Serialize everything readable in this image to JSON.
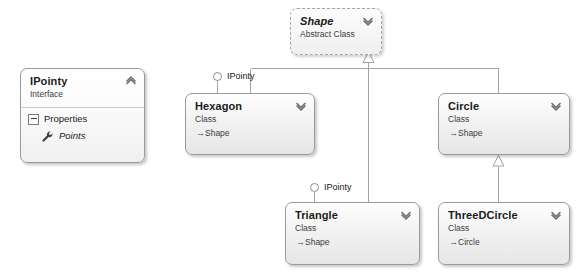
{
  "diagram": {
    "background": "#ffffff",
    "line_color": "#a0a0a0",
    "node_border": "#9a9a9a"
  },
  "nodes": {
    "shape": {
      "name": "Shape",
      "stereotype": "Abstract Class",
      "toggle": "chevron-down",
      "style": "abstract"
    },
    "ipointy": {
      "name": "IPointy",
      "stereotype": "Interface",
      "toggle": "chevron-up",
      "style": "interface",
      "compartment": {
        "label": "Properties",
        "expander": "collapse-box",
        "members": [
          {
            "name": "Points",
            "icon": "wrench-icon"
          }
        ]
      }
    },
    "hexagon": {
      "name": "Hexagon",
      "stereotype": "Class",
      "base": "Shape",
      "base_arrow": "→",
      "toggle": "chevron-down"
    },
    "circle": {
      "name": "Circle",
      "stereotype": "Class",
      "base": "Shape",
      "base_arrow": "→",
      "toggle": "chevron-down"
    },
    "triangle": {
      "name": "Triangle",
      "stereotype": "Class",
      "base": "Shape",
      "base_arrow": "→",
      "toggle": "chevron-down"
    },
    "threedcircle": {
      "name": "ThreeDCircle",
      "stereotype": "Class",
      "base": "Circle",
      "base_arrow": "→",
      "toggle": "chevron-down"
    }
  },
  "lollipops": [
    {
      "id": "hexagon-ipointy",
      "label": "IPointy",
      "attached_to": "Hexagon"
    },
    {
      "id": "triangle-ipointy",
      "label": "IPointy",
      "attached_to": "Triangle"
    }
  ],
  "relationships": [
    {
      "type": "inheritance",
      "from": "Hexagon",
      "to": "Shape"
    },
    {
      "type": "inheritance",
      "from": "Circle",
      "to": "Shape"
    },
    {
      "type": "inheritance",
      "from": "Triangle",
      "to": "Shape"
    },
    {
      "type": "inheritance",
      "from": "ThreeDCircle",
      "to": "Circle"
    },
    {
      "type": "realization",
      "from": "Hexagon",
      "to": "IPointy"
    },
    {
      "type": "realization",
      "from": "Triangle",
      "to": "IPointy"
    }
  ]
}
